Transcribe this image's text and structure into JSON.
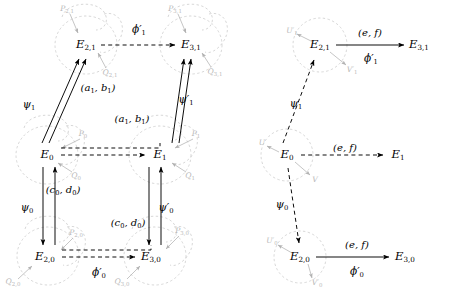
{
  "figure": {
    "colors": {
      "ink": "#000000",
      "faint": "#b9b9b9",
      "background": "#ffffff"
    }
  },
  "left_diagram": {
    "name": "left-cube-diagram",
    "nodes": [
      {
        "id": "E21",
        "label": "E",
        "sub": "2,1",
        "x": 86,
        "y": 45
      },
      {
        "id": "E31",
        "label": "E",
        "sub": "3,1",
        "x": 191,
        "y": 45
      },
      {
        "id": "E0",
        "label": "E",
        "sub": "0",
        "x": 47,
        "y": 155
      },
      {
        "id": "E1",
        "label": "E",
        "sub": "1",
        "x": 160,
        "y": 155
      },
      {
        "id": "E20",
        "label": "E",
        "sub": "2,0",
        "x": 45,
        "y": 257
      },
      {
        "id": "E30",
        "label": "E",
        "sub": "3,0",
        "x": 151,
        "y": 257
      }
    ],
    "map_labels": [
      {
        "id": "phi1p",
        "text": "ϕ′",
        "sub": "1",
        "x": 139,
        "y": 29
      },
      {
        "id": "psi1",
        "text": "ψ",
        "sub": "1",
        "x": 29,
        "y": 104
      },
      {
        "id": "psi1p",
        "text": "ψ′",
        "sub": "1",
        "x": 186,
        "y": 99
      },
      {
        "id": "psi0",
        "text": "ψ",
        "sub": "0",
        "x": 27,
        "y": 207
      },
      {
        "id": "psi0p",
        "text": "ψ′",
        "sub": "0",
        "x": 166,
        "y": 207
      },
      {
        "id": "phi0p",
        "text": "ϕ′",
        "sub": "0",
        "x": 99,
        "y": 272
      }
    ],
    "pair_labels": [
      {
        "id": "a1b1-left",
        "a": "a",
        "asub": "1",
        "b": "b",
        "bsub": "1",
        "x": 98,
        "y": 88
      },
      {
        "id": "a1b1-right",
        "a": "a",
        "asub": "1",
        "b": "b",
        "bsub": "1",
        "x": 132,
        "y": 119
      },
      {
        "id": "c0d0-left",
        "a": "c",
        "asub": "0",
        "b": "d",
        "bsub": "0",
        "x": 63,
        "y": 190
      },
      {
        "id": "c0d0-right",
        "a": "c",
        "asub": "0",
        "b": "d",
        "bsub": "0",
        "x": 128,
        "y": 223
      }
    ],
    "point_labels": [
      {
        "id": "P21",
        "letter": "P",
        "sub": "2,1",
        "x": 67,
        "y": 9
      },
      {
        "id": "Q21",
        "letter": "Q",
        "sub": "2,1",
        "x": 110,
        "y": 73
      },
      {
        "id": "P31",
        "letter": "P",
        "sub": "3,1",
        "x": 175,
        "y": 9
      },
      {
        "id": "Q31",
        "letter": "Q",
        "sub": "3,1",
        "x": 215,
        "y": 72
      },
      {
        "id": "P0",
        "letter": "P",
        "sub": "0",
        "x": 83,
        "y": 134
      },
      {
        "id": "Q0",
        "letter": "Q",
        "sub": "0",
        "x": 76,
        "y": 176
      },
      {
        "id": "P1",
        "letter": "P",
        "sub": "1",
        "x": 196,
        "y": 134
      },
      {
        "id": "Q1",
        "letter": "Q",
        "sub": "1",
        "x": 190,
        "y": 176
      },
      {
        "id": "P20",
        "letter": "P",
        "sub": "2,0",
        "x": 76,
        "y": 233
      },
      {
        "id": "Q20",
        "letter": "Q",
        "sub": "2,0",
        "x": 13,
        "y": 282
      },
      {
        "id": "P30",
        "letter": "P",
        "sub": "3,0",
        "x": 182,
        "y": 231
      },
      {
        "id": "Q30",
        "letter": "Q",
        "sub": "3,0",
        "x": 122,
        "y": 282
      }
    ]
  },
  "right_diagram": {
    "name": "right-kernel-diagram",
    "nodes": [
      {
        "id": "E21",
        "label": "E",
        "sub": "2,1",
        "x": 320,
        "y": 45
      },
      {
        "id": "E31",
        "label": "E",
        "sub": "3,1",
        "x": 419,
        "y": 45
      },
      {
        "id": "E0",
        "label": "E",
        "sub": "0",
        "x": 287,
        "y": 155
      },
      {
        "id": "E1",
        "label": "E",
        "sub": "1",
        "x": 398,
        "y": 155
      },
      {
        "id": "E20",
        "label": "E",
        "sub": "2,0",
        "x": 300,
        "y": 257
      },
      {
        "id": "E30",
        "label": "E",
        "sub": "3,0",
        "x": 405,
        "y": 257
      }
    ],
    "map_labels": [
      {
        "id": "ef-top",
        "text": "(e, f)",
        "sub": "",
        "x": 370,
        "y": 33
      },
      {
        "id": "phi1p",
        "text": "ϕ′",
        "sub": "1",
        "x": 371,
        "y": 58
      },
      {
        "id": "psi1",
        "text": "ψ",
        "sub": "1",
        "x": 296,
        "y": 103
      },
      {
        "id": "ef-mid",
        "text": "(e, f)",
        "sub": "",
        "x": 345,
        "y": 148
      },
      {
        "id": "psi0",
        "text": "ψ",
        "sub": "0",
        "x": 282,
        "y": 204
      },
      {
        "id": "ef-bottom",
        "text": "(e, f)",
        "sub": "",
        "x": 357,
        "y": 245
      },
      {
        "id": "phi0p",
        "text": "ϕ′",
        "sub": "0",
        "x": 357,
        "y": 271
      }
    ],
    "point_labels": [
      {
        "id": "U1p",
        "letter": "U′",
        "sub": "1",
        "x": 292,
        "y": 31
      },
      {
        "id": "V1p",
        "letter": "V′",
        "sub": "1",
        "x": 352,
        "y": 70
      },
      {
        "id": "U",
        "letter": "U",
        "sub": "",
        "x": 262,
        "y": 143
      },
      {
        "id": "V",
        "letter": "V",
        "sub": "",
        "x": 315,
        "y": 180
      },
      {
        "id": "U0p",
        "letter": "U′",
        "sub": "0",
        "x": 272,
        "y": 241
      },
      {
        "id": "V0p",
        "letter": "V′",
        "sub": "0",
        "x": 317,
        "y": 283
      }
    ]
  }
}
